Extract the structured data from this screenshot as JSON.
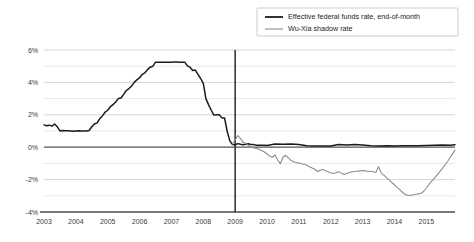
{
  "chart_data": {
    "type": "line",
    "title": "",
    "xlabel": "",
    "ylabel": "",
    "xlim": [
      2003.0,
      2015.9
    ],
    "ylim": [
      -4,
      6
    ],
    "ytick_labels": [
      "6%",
      "4%",
      "2%",
      "0%",
      "-2%",
      "-4%"
    ],
    "ytick_values": [
      6,
      4,
      2,
      0,
      -2,
      -4
    ],
    "yminor_values": [
      5,
      3,
      1,
      -1,
      -3
    ],
    "xtick_labels": [
      "2003",
      "2004",
      "2005",
      "2006",
      "2007",
      "2008",
      "2009",
      "2010",
      "2011",
      "2012",
      "2013",
      "2014",
      "2015"
    ],
    "xtick_values": [
      2003,
      2004,
      2005,
      2006,
      2007,
      2008,
      2009,
      2010,
      2011,
      2012,
      2013,
      2014,
      2015
    ],
    "grid": true,
    "legend_position": "top-right",
    "annotations": [
      {
        "type": "vertical-line",
        "x": 2009.0,
        "label": "2009 zero-lower-bound onset"
      }
    ],
    "series": [
      {
        "name": "Effective federal funds rate, end-of-month",
        "color": "#1a1a1a",
        "width": 1.5,
        "x": [
          2003.0,
          2003.083,
          2003.167,
          2003.25,
          2003.333,
          2003.417,
          2003.5,
          2003.583,
          2003.667,
          2003.75,
          2003.833,
          2003.917,
          2004.0,
          2004.083,
          2004.167,
          2004.25,
          2004.333,
          2004.417,
          2004.5,
          2004.583,
          2004.667,
          2004.75,
          2004.833,
          2004.917,
          2005.0,
          2005.083,
          2005.167,
          2005.25,
          2005.333,
          2005.417,
          2005.5,
          2005.583,
          2005.667,
          2005.75,
          2005.833,
          2005.917,
          2006.0,
          2006.083,
          2006.167,
          2006.25,
          2006.333,
          2006.417,
          2006.5,
          2006.583,
          2006.667,
          2006.75,
          2006.833,
          2006.917,
          2007.0,
          2007.083,
          2007.167,
          2007.25,
          2007.333,
          2007.417,
          2007.5,
          2007.583,
          2007.667,
          2007.75,
          2007.833,
          2007.917,
          2008.0,
          2008.083,
          2008.167,
          2008.25,
          2008.333,
          2008.417,
          2008.5,
          2008.583,
          2008.667,
          2008.75,
          2008.833,
          2008.917,
          2009.0,
          2009.083,
          2009.167,
          2009.25,
          2009.333,
          2009.417,
          2009.5,
          2009.583,
          2009.667,
          2009.75,
          2009.833,
          2009.917,
          2010.0,
          2010.25,
          2010.5,
          2010.75,
          2011.0,
          2011.25,
          2011.5,
          2011.75,
          2012.0,
          2012.25,
          2012.5,
          2012.75,
          2013.0,
          2013.25,
          2013.5,
          2013.75,
          2014.0,
          2014.25,
          2014.5,
          2014.75,
          2015.0,
          2015.25,
          2015.5,
          2015.75,
          2015.9
        ],
        "y": [
          1.38,
          1.32,
          1.36,
          1.3,
          1.43,
          1.26,
          1.01,
          1.03,
          1.01,
          1.01,
          1.0,
          0.98,
          1.0,
          1.01,
          1.0,
          1.0,
          1.0,
          1.03,
          1.26,
          1.43,
          1.5,
          1.76,
          1.93,
          2.16,
          2.28,
          2.5,
          2.63,
          2.79,
          3.0,
          3.04,
          3.26,
          3.5,
          3.62,
          3.78,
          4.0,
          4.16,
          4.29,
          4.49,
          4.59,
          4.79,
          4.94,
          5.0,
          5.25,
          5.25,
          5.25,
          5.25,
          5.25,
          5.24,
          5.25,
          5.26,
          5.26,
          5.25,
          5.25,
          5.25,
          5.02,
          4.94,
          4.74,
          4.76,
          4.49,
          4.24,
          3.94,
          2.98,
          2.61,
          2.28,
          1.98,
          2.0,
          2.01,
          1.81,
          1.81,
          0.97,
          0.39,
          0.16,
          0.15,
          0.22,
          0.18,
          0.15,
          0.18,
          0.21,
          0.16,
          0.16,
          0.12,
          0.12,
          0.12,
          0.12,
          0.11,
          0.2,
          0.18,
          0.19,
          0.17,
          0.09,
          0.07,
          0.08,
          0.08,
          0.16,
          0.14,
          0.16,
          0.14,
          0.09,
          0.08,
          0.09,
          0.07,
          0.09,
          0.09,
          0.09,
          0.11,
          0.12,
          0.14,
          0.12,
          0.15
        ]
      },
      {
        "name": "Wu-Xia shadow rate",
        "color": "#8c8c8c",
        "width": 1.1,
        "x": [
          2008.917,
          2009.0,
          2009.083,
          2009.167,
          2009.25,
          2009.333,
          2009.417,
          2009.5,
          2009.583,
          2009.667,
          2009.75,
          2009.833,
          2009.917,
          2010.0,
          2010.083,
          2010.167,
          2010.25,
          2010.333,
          2010.417,
          2010.5,
          2010.583,
          2010.667,
          2010.75,
          2010.833,
          2010.917,
          2011.0,
          2011.083,
          2011.167,
          2011.25,
          2011.333,
          2011.417,
          2011.5,
          2011.583,
          2011.667,
          2011.75,
          2011.833,
          2011.917,
          2012.0,
          2012.083,
          2012.167,
          2012.25,
          2012.333,
          2012.417,
          2012.5,
          2012.583,
          2012.667,
          2012.75,
          2012.833,
          2012.917,
          2013.0,
          2013.083,
          2013.167,
          2013.25,
          2013.333,
          2013.417,
          2013.5,
          2013.583,
          2013.667,
          2013.75,
          2013.833,
          2013.917,
          2014.0,
          2014.083,
          2014.167,
          2014.25,
          2014.333,
          2014.417,
          2014.5,
          2014.583,
          2014.667,
          2014.75,
          2014.833,
          2014.917,
          2015.0,
          2015.083,
          2015.167,
          2015.25,
          2015.333,
          2015.417,
          2015.5,
          2015.583,
          2015.667,
          2015.75,
          2015.833,
          2015.9
        ],
        "y": [
          0.2,
          0.44,
          0.72,
          0.55,
          0.3,
          0.24,
          0.1,
          0.02,
          -0.05,
          -0.08,
          -0.12,
          -0.2,
          -0.3,
          -0.42,
          -0.55,
          -0.62,
          -0.48,
          -0.78,
          -1.02,
          -0.62,
          -0.5,
          -0.65,
          -0.82,
          -0.9,
          -0.95,
          -0.98,
          -1.02,
          -1.05,
          -1.12,
          -1.2,
          -1.28,
          -1.36,
          -1.5,
          -1.42,
          -1.38,
          -1.45,
          -1.52,
          -1.58,
          -1.62,
          -1.58,
          -1.52,
          -1.6,
          -1.68,
          -1.62,
          -1.56,
          -1.52,
          -1.5,
          -1.48,
          -1.46,
          -1.44,
          -1.46,
          -1.48,
          -1.5,
          -1.52,
          -1.56,
          -1.2,
          -1.58,
          -1.72,
          -1.88,
          -2.02,
          -2.18,
          -2.32,
          -2.48,
          -2.62,
          -2.78,
          -2.92,
          -2.96,
          -2.98,
          -2.94,
          -2.9,
          -2.88,
          -2.86,
          -2.72,
          -2.52,
          -2.3,
          -2.1,
          -1.92,
          -1.72,
          -1.52,
          -1.32,
          -1.1,
          -0.88,
          -0.62,
          -0.38,
          -0.18
        ]
      }
    ]
  },
  "legend": {
    "items": [
      {
        "label": "Effective federal funds rate, end-of-month",
        "color": "#1a1a1a"
      },
      {
        "label": "Wu-Xia shadow rate",
        "color": "#8c8c8c"
      }
    ]
  }
}
